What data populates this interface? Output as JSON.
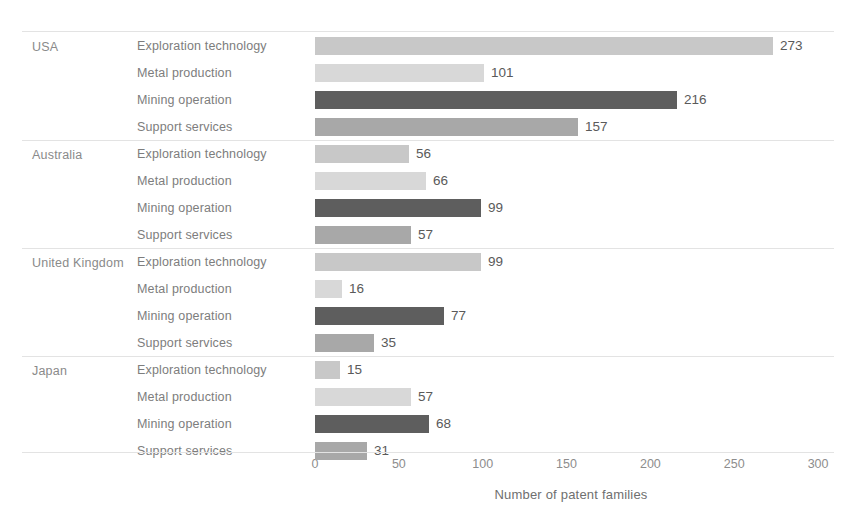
{
  "chart_data": {
    "type": "bar",
    "orientation": "horizontal",
    "title": "",
    "xlabel": "Number of patent families",
    "ylabel": "",
    "xlim": [
      0,
      300
    ],
    "xticks": [
      0,
      50,
      100,
      150,
      200,
      250,
      300
    ],
    "xtick_labels": [
      "0",
      "50",
      "100",
      "150",
      "200",
      "250",
      "300"
    ],
    "grid": false,
    "legend": "none",
    "categories": [
      "Exploration technology",
      "Metal production",
      "Mining operation",
      "Support services"
    ],
    "groups": [
      "USA",
      "Australia",
      "United Kingdom",
      "Japan"
    ],
    "series": [
      {
        "name": "USA",
        "values": [
          273,
          101,
          216,
          157
        ]
      },
      {
        "name": "Australia",
        "values": [
          56,
          66,
          99,
          57
        ]
      },
      {
        "name": "United Kingdom",
        "values": [
          99,
          16,
          77,
          35
        ]
      },
      {
        "name": "Japan",
        "values": [
          15,
          57,
          68,
          31
        ]
      }
    ],
    "bar_colors": [
      "#c8c8c8",
      "#d8d8d8",
      "#5e5e5e",
      "#a8a8a8"
    ]
  },
  "axis": {
    "title": "Number of patent families",
    "ticks": [
      {
        "label": "0",
        "value": 0
      },
      {
        "label": "50",
        "value": 50
      },
      {
        "label": "100",
        "value": 100
      },
      {
        "label": "150",
        "value": 150
      },
      {
        "label": "200",
        "value": 200
      },
      {
        "label": "250",
        "value": 250
      },
      {
        "label": "300",
        "value": 300
      }
    ]
  },
  "groups": [
    {
      "country": "USA",
      "rows": [
        {
          "category": "Exploration technology",
          "value": 273,
          "value_label": "273",
          "color": "#c8c8c8"
        },
        {
          "category": "Metal production",
          "value": 101,
          "value_label": "101",
          "color": "#d8d8d8"
        },
        {
          "category": "Mining operation",
          "value": 216,
          "value_label": "216",
          "color": "#5e5e5e"
        },
        {
          "category": "Support services",
          "value": 157,
          "value_label": "157",
          "color": "#a8a8a8"
        }
      ]
    },
    {
      "country": "Australia",
      "rows": [
        {
          "category": "Exploration technology",
          "value": 56,
          "value_label": "56",
          "color": "#c8c8c8"
        },
        {
          "category": "Metal production",
          "value": 66,
          "value_label": "66",
          "color": "#d8d8d8"
        },
        {
          "category": "Mining operation",
          "value": 99,
          "value_label": "99",
          "color": "#5e5e5e"
        },
        {
          "category": "Support services",
          "value": 57,
          "value_label": "57",
          "color": "#a8a8a8"
        }
      ]
    },
    {
      "country": "United Kingdom",
      "rows": [
        {
          "category": "Exploration technology",
          "value": 99,
          "value_label": "99",
          "color": "#c8c8c8"
        },
        {
          "category": "Metal production",
          "value": 16,
          "value_label": "16",
          "color": "#d8d8d8"
        },
        {
          "category": "Mining operation",
          "value": 77,
          "value_label": "77",
          "color": "#5e5e5e"
        },
        {
          "category": "Support services",
          "value": 35,
          "value_label": "35",
          "color": "#a8a8a8"
        }
      ]
    },
    {
      "country": "Japan",
      "rows": [
        {
          "category": "Exploration technology",
          "value": 15,
          "value_label": "15",
          "color": "#c8c8c8"
        },
        {
          "category": "Metal production",
          "value": 57,
          "value_label": "57",
          "color": "#d8d8d8"
        },
        {
          "category": "Mining operation",
          "value": 68,
          "value_label": "68",
          "color": "#5e5e5e"
        },
        {
          "category": "Support services",
          "value": 31,
          "value_label": "31",
          "color": "#a8a8a8"
        }
      ]
    }
  ]
}
